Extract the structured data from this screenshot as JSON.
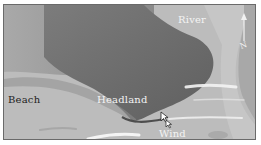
{
  "map": {
    "labels": {
      "river": "River",
      "headland": "Headland",
      "beach": "Beach",
      "wind": "Wind"
    },
    "compass": {
      "north_label": "N"
    },
    "colors": {
      "sea": "#bdbdbd",
      "headland_land": "#6e6e6e",
      "upper_land": "#9a9a9a",
      "river": "#c4c4c4",
      "beach": "#b3b3b3",
      "wave_streak": "#f2f2f2",
      "frame_border": "#6a6a6a"
    }
  }
}
